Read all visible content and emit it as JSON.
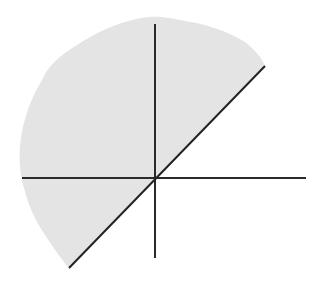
{
  "diagram": {
    "type": "half-plane inequality graph",
    "origin": [
      155,
      178
    ],
    "x_axis": {
      "x1": 22,
      "y1": 178,
      "x2": 306,
      "y2": 178
    },
    "y_axis": {
      "x1": 155,
      "y1": 24,
      "x2": 155,
      "y2": 258
    },
    "boundary_line": {
      "label": "y = x",
      "x1": 69,
      "y1": 268,
      "x2": 265,
      "y2": 66,
      "style": "solid"
    },
    "shaded_region": {
      "side": "above-left of line",
      "fill": "#e4e4e4"
    },
    "colors": {
      "background": "#ffffff",
      "axis": "#2a2a2a",
      "line": "#222222",
      "shade": "#e4e4e4"
    }
  }
}
